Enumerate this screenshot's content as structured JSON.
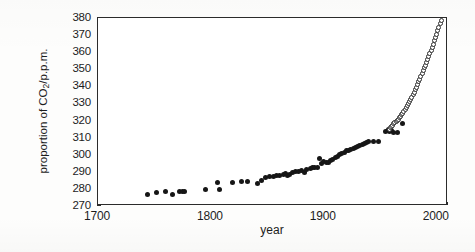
{
  "chart_data": {
    "type": "scatter",
    "title": "",
    "xlabel": "year",
    "ylabel": "proportion of CO2/p.p.m.",
    "ylabel_parts": {
      "prefix": "proportion of CO",
      "sub": "2",
      "suffix": "/p.p.m."
    },
    "xlim": [
      1700,
      2010
    ],
    "ylim": [
      270,
      380
    ],
    "x_ticks": [
      1700,
      1800,
      1900,
      2000
    ],
    "x_tick_labels": [
      "1700",
      "1800",
      "1900",
      "2000"
    ],
    "x_minor_tick_step": 10,
    "y_ticks": [
      270,
      280,
      290,
      300,
      310,
      320,
      330,
      340,
      350,
      360,
      370,
      380
    ],
    "y_tick_labels": [
      "270",
      "280",
      "290",
      "300",
      "310",
      "320",
      "330",
      "340",
      "350",
      "360",
      "370",
      "380"
    ],
    "grid": false,
    "legend": false,
    "legend_position": "none",
    "marker_colors": {
      "filled": "#161616",
      "open_edge": "#2e2e2e",
      "open_fill": "#ffffff"
    },
    "series": [
      {
        "name": "ice core record",
        "marker": "filled-circle",
        "points": [
          [
            1744,
            276.6
          ],
          [
            1752,
            277.8
          ],
          [
            1760,
            278.6
          ],
          [
            1766,
            276.8
          ],
          [
            1772,
            278.6
          ],
          [
            1775,
            278.7
          ],
          [
            1777,
            278.6
          ],
          [
            1795,
            279.4
          ],
          [
            1806,
            284.0
          ],
          [
            1808,
            279.8
          ],
          [
            1819,
            283.9
          ],
          [
            1827,
            284.1
          ],
          [
            1832,
            284.1
          ],
          [
            1841,
            283.3
          ],
          [
            1845,
            285.1
          ],
          [
            1848,
            286.6
          ],
          [
            1852,
            287.2
          ],
          [
            1855,
            287.4
          ],
          [
            1858,
            287.9
          ],
          [
            1861,
            288.0
          ],
          [
            1864,
            288.2
          ],
          [
            1866,
            289.3
          ],
          [
            1868,
            287.9
          ],
          [
            1870,
            288.5
          ],
          [
            1872,
            289.6
          ],
          [
            1875,
            290.0
          ],
          [
            1878,
            290.2
          ],
          [
            1880,
            290.6
          ],
          [
            1883,
            289.6
          ],
          [
            1885,
            291.3
          ],
          [
            1888,
            292.0
          ],
          [
            1890,
            292.4
          ],
          [
            1892,
            292.5
          ],
          [
            1894,
            292.6
          ],
          [
            1896,
            297.7
          ],
          [
            1898,
            294.6
          ],
          [
            1900,
            296.1
          ],
          [
            1902,
            295.7
          ],
          [
            1904,
            295.2
          ],
          [
            1906,
            296.5
          ],
          [
            1908,
            297.4
          ],
          [
            1910,
            298.2
          ],
          [
            1912,
            299.2
          ],
          [
            1914,
            300.1
          ],
          [
            1916,
            300.8
          ],
          [
            1918,
            301.4
          ],
          [
            1920,
            302.6
          ],
          [
            1922,
            302.4
          ],
          [
            1924,
            303.0
          ],
          [
            1926,
            303.7
          ],
          [
            1928,
            304.3
          ],
          [
            1930,
            305.0
          ],
          [
            1932,
            305.4
          ],
          [
            1934,
            305.8
          ],
          [
            1936,
            306.5
          ],
          [
            1938,
            307.2
          ],
          [
            1940,
            307.6
          ],
          [
            1944,
            308.0
          ],
          [
            1948,
            307.6
          ],
          [
            1955,
            313.4
          ],
          [
            1957,
            314.8
          ],
          [
            1958,
            313.4
          ],
          [
            1960,
            314.0
          ],
          [
            1962,
            313.2
          ],
          [
            1965,
            313.0
          ],
          [
            1970,
            318.2
          ]
        ]
      },
      {
        "name": "direct atmospheric measurement",
        "marker": "open-circle",
        "points": [
          [
            1958,
            315.0
          ],
          [
            1959,
            315.8
          ],
          [
            1960,
            316.6
          ],
          [
            1961,
            317.3
          ],
          [
            1962,
            318.1
          ],
          [
            1963,
            318.8
          ],
          [
            1964,
            319.4
          ],
          [
            1965,
            320.0
          ],
          [
            1966,
            320.9
          ],
          [
            1967,
            321.7
          ],
          [
            1968,
            322.5
          ],
          [
            1969,
            323.4
          ],
          [
            1970,
            324.4
          ],
          [
            1971,
            325.4
          ],
          [
            1972,
            326.5
          ],
          [
            1973,
            327.6
          ],
          [
            1974,
            328.7
          ],
          [
            1975,
            329.9
          ],
          [
            1976,
            331.0
          ],
          [
            1977,
            332.3
          ],
          [
            1978,
            333.6
          ],
          [
            1979,
            335.0
          ],
          [
            1980,
            336.5
          ],
          [
            1981,
            338.0
          ],
          [
            1982,
            339.5
          ],
          [
            1983,
            341.0
          ],
          [
            1984,
            342.6
          ],
          [
            1985,
            344.2
          ],
          [
            1986,
            345.8
          ],
          [
            1987,
            347.4
          ],
          [
            1988,
            349.1
          ],
          [
            1989,
            350.8
          ],
          [
            1990,
            352.5
          ],
          [
            1991,
            354.2
          ],
          [
            1992,
            355.9
          ],
          [
            1993,
            357.5
          ],
          [
            1994,
            359.2
          ],
          [
            1995,
            361.0
          ],
          [
            1996,
            362.8
          ],
          [
            1997,
            364.6
          ],
          [
            1998,
            366.6
          ],
          [
            1999,
            368.5
          ],
          [
            2000,
            370.5
          ],
          [
            2001,
            372.5
          ],
          [
            2002,
            374.6
          ],
          [
            2003,
            376.8
          ],
          [
            2004,
            378.3
          ]
        ]
      }
    ]
  }
}
